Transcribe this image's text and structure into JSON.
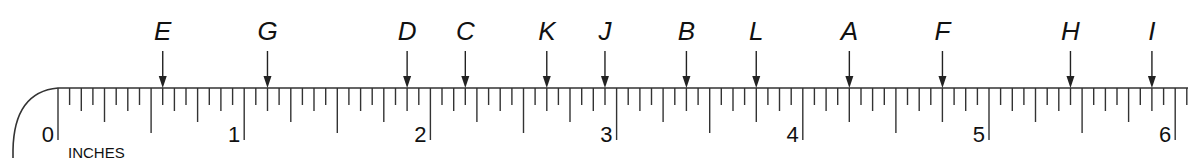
{
  "diagram": {
    "type": "ruler",
    "units_label": "INCHES",
    "range_inches": [
      0,
      6
    ],
    "subdivisions_per_inch": 16,
    "inch_labels": [
      "0",
      "1",
      "2",
      "3",
      "4",
      "5",
      "6"
    ],
    "line_color": "#333333",
    "text_color": "#111111",
    "markers": [
      {
        "label": "E",
        "inches": 0.5625
      },
      {
        "label": "G",
        "inches": 1.125
      },
      {
        "label": "D",
        "inches": 1.875
      },
      {
        "label": "C",
        "inches": 2.1875
      },
      {
        "label": "K",
        "inches": 2.625
      },
      {
        "label": "J",
        "inches": 2.9375
      },
      {
        "label": "B",
        "inches": 3.375
      },
      {
        "label": "L",
        "inches": 3.75
      },
      {
        "label": "A",
        "inches": 4.25
      },
      {
        "label": "F",
        "inches": 4.75
      },
      {
        "label": "H",
        "inches": 5.4375
      },
      {
        "label": "I",
        "inches": 5.875
      }
    ]
  }
}
